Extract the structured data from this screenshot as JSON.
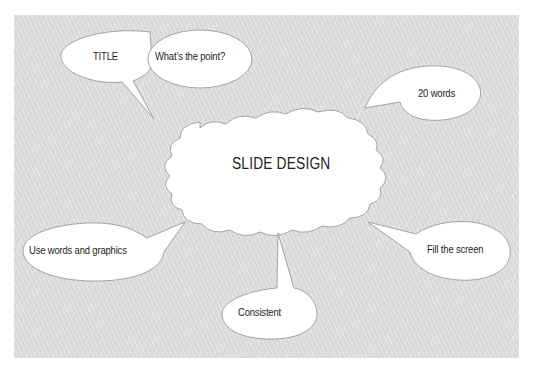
{
  "diagram": {
    "type": "mind-map",
    "center": {
      "label": "SLIDE DESIGN",
      "shape": "cloud"
    },
    "bubbles": [
      {
        "id": "title",
        "label": "TITLE",
        "position": "top-left"
      },
      {
        "id": "point",
        "label": "What’s the point?",
        "position": "top-left"
      },
      {
        "id": "words",
        "label": "20 words",
        "position": "top-right"
      },
      {
        "id": "graphics",
        "label": "Use words and graphics",
        "position": "bottom-left"
      },
      {
        "id": "consistent",
        "label": "Consistent",
        "position": "bottom-center"
      },
      {
        "id": "fill",
        "label": "Fill the screen",
        "position": "bottom-right"
      }
    ],
    "colors": {
      "background": "#d9d9d9",
      "bubble_fill": "#ffffff",
      "bubble_stroke": "#9a9a9a",
      "text": "#1e1e1e"
    }
  }
}
